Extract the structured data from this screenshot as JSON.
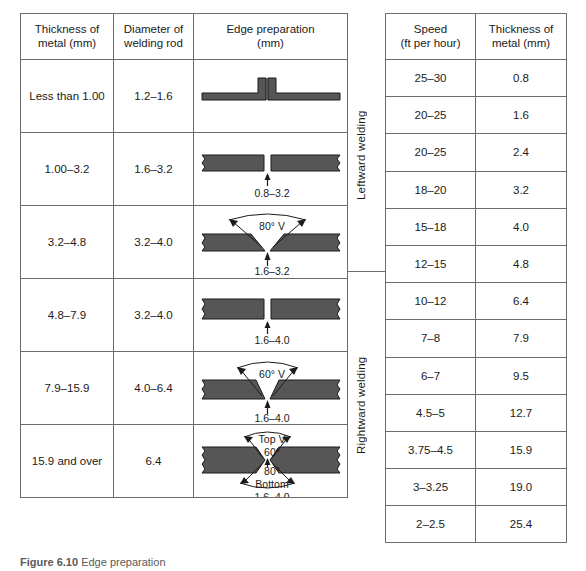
{
  "left_table": {
    "headers": [
      {
        "line1": "Thickness of",
        "line2": "metal (mm)"
      },
      {
        "line1": "Diameter of",
        "line2": "welding rod"
      },
      {
        "line1": "Edge preparation",
        "line2": "(mm)"
      }
    ],
    "rows": [
      {
        "thickness": "Less than 1.00",
        "rod_diameter": "1.2–1.6",
        "prep_type": "flanged-butt",
        "gap_label": "",
        "angle_label": "",
        "angle_label2": ""
      },
      {
        "thickness": "1.00–3.2",
        "rod_diameter": "1.6–3.2",
        "prep_type": "square-butt",
        "gap_label": "0.8–3.2",
        "angle_label": "",
        "angle_label2": ""
      },
      {
        "thickness": "3.2–4.8",
        "rod_diameter": "3.2–4.0",
        "prep_type": "single-v",
        "gap_label": "1.6–3.2",
        "angle_label": "80° V",
        "angle_label2": ""
      },
      {
        "thickness": "4.8–7.9",
        "rod_diameter": "3.2–4.0",
        "prep_type": "square-butt",
        "gap_label": "1.6–4.0",
        "angle_label": "",
        "angle_label2": ""
      },
      {
        "thickness": "7.9–15.9",
        "rod_diameter": "4.0–6.4",
        "prep_type": "single-v",
        "gap_label": "1.6–4.0",
        "angle_label": "60° V",
        "angle_label2": ""
      },
      {
        "thickness": "15.9 and over",
        "rod_diameter": "6.4",
        "prep_type": "double-v",
        "gap_label": "1.6–4.0",
        "angle_label": "Top V",
        "angle_label2": "60°",
        "angle_label3": "80°",
        "angle_label4": "Bottom"
      }
    ]
  },
  "right_table": {
    "headers": [
      {
        "line1": "Speed",
        "line2": "(ft per hour)"
      },
      {
        "line1": "Thickness of",
        "line2": "metal (mm)"
      }
    ],
    "rows": [
      {
        "speed": "25–30",
        "thickness": "0.8"
      },
      {
        "speed": "20–25",
        "thickness": "1.6"
      },
      {
        "speed": "20–25",
        "thickness": "2.4"
      },
      {
        "speed": "18–20",
        "thickness": "3.2"
      },
      {
        "speed": "15–18",
        "thickness": "4.0"
      },
      {
        "speed": "12–15",
        "thickness": "4.8"
      },
      {
        "speed": "10–12",
        "thickness": "6.4"
      },
      {
        "speed": "7–8",
        "thickness": "7.9"
      },
      {
        "speed": "6–7",
        "thickness": "9.5"
      },
      {
        "speed": "4.5–5",
        "thickness": "12.7"
      },
      {
        "speed": "3.75–4.5",
        "thickness": "15.9"
      },
      {
        "speed": "3–3.25",
        "thickness": "19.0"
      },
      {
        "speed": "2–2.5",
        "thickness": "25.4"
      }
    ],
    "section_labels": {
      "leftward": "Leftward welding",
      "rightward": "Rightward welding"
    }
  },
  "caption": {
    "number": "Figure 6.10",
    "text": "Edge preparation"
  },
  "colors": {
    "plate_fill": "#565656",
    "plate_stroke": "#1b1b1b",
    "rule": "#6d6d6d",
    "text": "#1b1b1b"
  }
}
